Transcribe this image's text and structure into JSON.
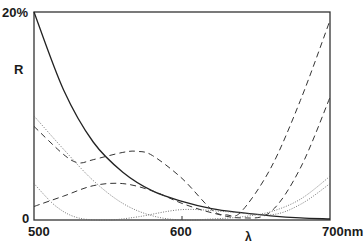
{
  "chart_data": {
    "type": "line",
    "title": "",
    "xlabel": "λ",
    "ylabel": "R",
    "x_unit": "nm",
    "xlim": [
      500,
      700
    ],
    "ylim": [
      0,
      20
    ],
    "x_ticks": [
      "500",
      "600",
      "700nm"
    ],
    "y_ticks": [
      "0",
      "20%"
    ],
    "grid": false,
    "legend": null,
    "series": [
      {
        "name": "solid",
        "style": "solid",
        "x": [
          500,
          520,
          540,
          560,
          580,
          600,
          620,
          640,
          660,
          680,
          700
        ],
        "y": [
          20,
          12.5,
          7.5,
          4.6,
          2.8,
          1.8,
          1.1,
          0.7,
          0.4,
          0.2,
          0.1
        ]
      },
      {
        "name": "dashed-upper-hump",
        "style": "dashed",
        "x": [
          500,
          520,
          530,
          540,
          560,
          570,
          580,
          600,
          620,
          630,
          640,
          660,
          680,
          700
        ],
        "y": [
          9.0,
          6.3,
          5.5,
          5.8,
          6.5,
          6.6,
          6.2,
          4.0,
          1.0,
          0.5,
          0.8,
          5.0,
          11.5,
          19.2
        ]
      },
      {
        "name": "dashed-lower-hump",
        "style": "dashed",
        "x": [
          500,
          520,
          540,
          560,
          580,
          600,
          620,
          640,
          660,
          680,
          700
        ],
        "y": [
          1.3,
          2.3,
          3.3,
          3.5,
          2.8,
          1.6,
          0.7,
          0.2,
          0.8,
          5.0,
          11.8
        ]
      },
      {
        "name": "dotted-1",
        "style": "dotted",
        "x": [
          500,
          520,
          540,
          560,
          580,
          600,
          620,
          640,
          660,
          680,
          700
        ],
        "y": [
          10.0,
          6.8,
          3.8,
          1.6,
          0.4,
          0.0,
          0.1,
          0.3,
          0.8,
          2.0,
          4.2
        ]
      },
      {
        "name": "dotted-2",
        "style": "dotted",
        "x": [
          500,
          515,
          530,
          550,
          570,
          600,
          630,
          660,
          680,
          700
        ],
        "y": [
          3.5,
          1.3,
          0.2,
          0.0,
          0.3,
          1.0,
          0.8,
          0.5,
          1.5,
          3.5
        ]
      }
    ]
  },
  "labels": {
    "y_top": "20%",
    "y_label": "R",
    "y_zero": "0",
    "x_start": "500",
    "x_mid": "600",
    "x_end": "700nm",
    "x_label": "λ"
  }
}
